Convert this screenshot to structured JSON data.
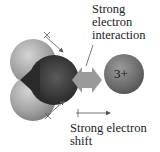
{
  "diagram": {
    "labels": {
      "top": [
        "Strong",
        "electron",
        "interaction"
      ],
      "bottom": [
        "Strong electron",
        "shift"
      ]
    },
    "ion": {
      "charge": "3+"
    },
    "molecule": "water (H2O) space-filling model",
    "colors": {
      "hydrogen": "#a8a8a8",
      "oxygen": "#3a3a3a",
      "ion": "#6e6e6e",
      "interaction_arrow": "#9a9a9a",
      "text": "#222222"
    }
  }
}
